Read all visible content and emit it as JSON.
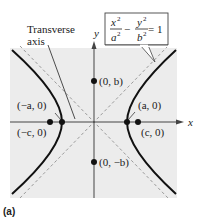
{
  "figure": {
    "caption": "(a)",
    "equation": {
      "x_num": "x",
      "x_den": "a",
      "y_num": "y",
      "y_den": "b",
      "exp": "2",
      "minus": "−",
      "rhs": "= 1",
      "full_text": "x^2/a^2 − y^2/b^2 = 1"
    },
    "callout": {
      "line1": "Transverse",
      "line2": "axis"
    },
    "axes": {
      "x_label": "x",
      "y_label": "y"
    },
    "points": {
      "neg_vertex": "(−a, 0)",
      "pos_vertex": "(a, 0)",
      "neg_focus": "(−c, 0)",
      "pos_focus": "(c, 0)",
      "co_vertex_top": "(0, b)",
      "co_vertex_bottom": "(0, −b)"
    },
    "colors": {
      "background_panel": "#ececec",
      "curve": "#111111",
      "asymptote": "#9a9a9a",
      "axis": "#444444"
    }
  }
}
